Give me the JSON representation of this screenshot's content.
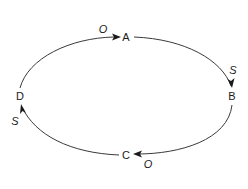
{
  "diagram": {
    "type": "cycle",
    "direction": "clockwise",
    "nodes": [
      {
        "id": "A",
        "label": "A"
      },
      {
        "id": "B",
        "label": "B"
      },
      {
        "id": "C",
        "label": "C"
      },
      {
        "id": "D",
        "label": "D"
      }
    ],
    "edges": [
      {
        "from": "D",
        "to": "A",
        "label": "O"
      },
      {
        "from": "A",
        "to": "B",
        "label": "S"
      },
      {
        "from": "B",
        "to": "C",
        "label": "O"
      },
      {
        "from": "C",
        "to": "D",
        "label": "S"
      }
    ],
    "colors": {
      "line": "#3a3a3a",
      "text": "#1a1a1a",
      "background": "#ffffff"
    }
  }
}
